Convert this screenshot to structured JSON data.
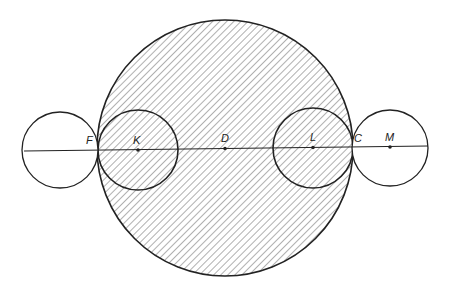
{
  "diagram": {
    "colors": {
      "stroke": "#222222",
      "hatch": "#6e6e6e",
      "background": "#ffffff"
    },
    "main_circle": {
      "cx": 225,
      "cy": 148,
      "r": 128,
      "hatched": true
    },
    "inner_circles": [
      {
        "id": "K",
        "cx": 138,
        "cy": 150,
        "r": 40
      },
      {
        "id": "L",
        "cx": 313,
        "cy": 148,
        "r": 40
      }
    ],
    "outer_circles": [
      {
        "id": "left",
        "cx": 60,
        "cy": 150,
        "r": 38
      },
      {
        "id": "M",
        "cx": 390,
        "cy": 148,
        "r": 38
      }
    ],
    "axis_line": {
      "x1": 24,
      "y1": 151,
      "x2": 428,
      "y2": 146
    },
    "points": [
      {
        "label": "F",
        "x": 98,
        "y": 150,
        "dot": false
      },
      {
        "label": "K",
        "x": 138,
        "y": 150,
        "dot": true
      },
      {
        "label": "D",
        "x": 225,
        "y": 148,
        "dot": true
      },
      {
        "label": "L",
        "x": 313,
        "y": 148,
        "dot": true
      },
      {
        "label": "C",
        "x": 352,
        "y": 147,
        "dot": false
      },
      {
        "label": "M",
        "x": 390,
        "y": 147,
        "dot": true
      }
    ],
    "labels": {
      "F": "F",
      "K": "K",
      "D": "D",
      "L": "L",
      "C": "C",
      "M": "M"
    }
  }
}
